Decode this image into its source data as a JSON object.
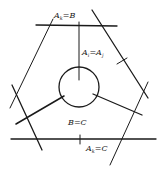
{
  "diagram": {
    "labels": {
      "top": {
        "main": "A",
        "sub": "k",
        "rest": "=B"
      },
      "middle": {
        "main": "A",
        "sub": "i",
        "rest": "=A",
        "sub2": "j"
      },
      "center_bottom": "B=C",
      "bottom": {
        "main": "A",
        "sub": "k",
        "rest": "=C"
      }
    },
    "colors": {
      "line": "#1a1a1a",
      "background": "#ffffff"
    }
  }
}
